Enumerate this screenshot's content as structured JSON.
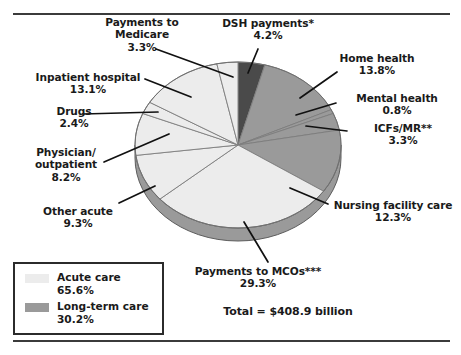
{
  "chart_data": {
    "type": "pie",
    "title": "",
    "total_label": "Total = $408.9 billion",
    "unit": "percent",
    "categories": [
      "DSH payments*",
      "Home health",
      "Mental health",
      "ICFs/MR**",
      "Nursing facility care",
      "Payments to MCOs***",
      "Other acute",
      "Physician/outpatient",
      "Drugs",
      "Inpatient hospital",
      "Payments to Medicare"
    ],
    "values": [
      4.2,
      13.8,
      0.8,
      3.3,
      12.3,
      29.3,
      9.3,
      8.2,
      2.4,
      13.1,
      3.3
    ],
    "slice_groups": [
      "dsh",
      "long-term",
      "long-term",
      "long-term",
      "long-term",
      "acute",
      "acute",
      "acute",
      "acute",
      "acute",
      "acute"
    ],
    "legend_position": "bottom-left",
    "grid": false
  },
  "labels": [
    {
      "id": "medicare",
      "name": "Payments to Medicare",
      "line1": "Payments to",
      "line2": "Medicare",
      "pct": "3.3%"
    },
    {
      "id": "dsh",
      "name": "DSH payments*",
      "line1": "DSH payments*",
      "line2": "",
      "pct": "4.2%"
    },
    {
      "id": "home",
      "name": "Home health",
      "line1": "Home health",
      "line2": "",
      "pct": "13.8%"
    },
    {
      "id": "inpatient",
      "name": "Inpatient hospital",
      "line1": "Inpatient hospital",
      "line2": "",
      "pct": "13.1%"
    },
    {
      "id": "mental",
      "name": "Mental health",
      "line1": "Mental health",
      "line2": "",
      "pct": "0.8%"
    },
    {
      "id": "drugs",
      "name": "Drugs",
      "line1": "Drugs",
      "line2": "",
      "pct": "2.4%"
    },
    {
      "id": "icfs",
      "name": "ICFs/MR**",
      "line1": "ICFs/MR**",
      "line2": "",
      "pct": "3.3%"
    },
    {
      "id": "physician",
      "name": "Physician/outpatient",
      "line1": "Physician/",
      "line2": "outpatient",
      "pct": "8.2%"
    },
    {
      "id": "other",
      "name": "Other acute",
      "line1": "Other acute",
      "line2": "",
      "pct": "9.3%"
    },
    {
      "id": "nursing",
      "name": "Nursing facility care",
      "line1": "Nursing facility care",
      "line2": "",
      "pct": "12.3%"
    },
    {
      "id": "mcos",
      "name": "Payments to MCOs***",
      "line1": "Payments to MCOs***",
      "line2": "",
      "pct": "29.3%"
    }
  ],
  "callouts": {
    "medicare": {
      "line1": "Payments to",
      "line2": "Medicare",
      "pct": "3.3%"
    },
    "dsh": {
      "line1": "DSH payments*",
      "pct": "4.2%"
    },
    "home": {
      "line1": "Home health",
      "pct": "13.8%"
    },
    "inpatient": {
      "line1": "Inpatient hospital",
      "pct": "13.1%"
    },
    "mental": {
      "line1": "Mental health",
      "pct": "0.8%"
    },
    "drugs": {
      "line1": "Drugs",
      "pct": "2.4%"
    },
    "icfs": {
      "line1": "ICFs/MR**",
      "pct": "3.3%"
    },
    "physician": {
      "line1": "Physician/",
      "line2": "outpatient",
      "pct": "8.2%"
    },
    "other": {
      "line1": "Other acute",
      "pct": "9.3%"
    },
    "nursing": {
      "line1": "Nursing facility care",
      "pct": "12.3%"
    },
    "mcos": {
      "line1": "Payments to MCOs***",
      "pct": "29.3%"
    }
  },
  "total": {
    "text": "Total = $408.9 billion"
  },
  "legend": {
    "items": [
      {
        "label": "Acute care",
        "pct": "65.6%",
        "color": "#ececec"
      },
      {
        "label": "Long-term care",
        "pct": "30.2%",
        "color": "#9a9a9a"
      }
    ]
  },
  "colors": {
    "acute": "#ececec",
    "long_term": "#9a9a9a",
    "dsh": "#4a4a4a",
    "rim": "#9a9a9a",
    "rim_dark": "#4a4a4a",
    "outline": "#6f6f6f",
    "rule": "#3b3b3b",
    "text": "#1a1a1a"
  }
}
